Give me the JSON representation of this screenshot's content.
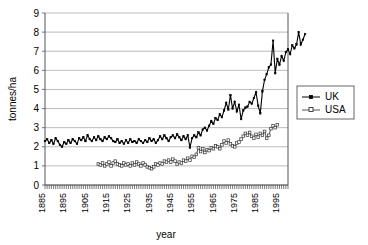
{
  "chart_data": {
    "type": "line",
    "title": "",
    "xlabel": "year",
    "ylabel": "tonnes/ha",
    "xlim": [
      1885,
      1999
    ],
    "ylim": [
      0,
      9
    ],
    "ytick_labels": [
      "0",
      "1",
      "2",
      "3",
      "4",
      "5",
      "6",
      "7",
      "8",
      "9"
    ],
    "xtick_labels": [
      "1885",
      "1895",
      "1905",
      "1915",
      "1925",
      "1935",
      "1945",
      "1955",
      "1965",
      "1975",
      "1985",
      "1995"
    ],
    "xtick_step": 10,
    "minor_xtick_step": 1,
    "grid": "horizontal",
    "legend_position": "right-outside",
    "legend_entries": [
      "UK",
      "USA"
    ],
    "series": [
      {
        "name": "UK",
        "marker": "filled-square",
        "color": "#000000",
        "x_start": 1885,
        "values": [
          2.3,
          2.4,
          2.2,
          2.35,
          2.15,
          2.45,
          2.3,
          2.1,
          2.0,
          2.25,
          2.15,
          2.35,
          2.2,
          2.4,
          2.3,
          2.15,
          2.45,
          2.35,
          2.5,
          2.3,
          2.6,
          2.4,
          2.3,
          2.5,
          2.35,
          2.55,
          2.4,
          2.3,
          2.5,
          2.4,
          2.55,
          2.45,
          2.3,
          2.25,
          2.4,
          2.2,
          2.3,
          2.15,
          2.35,
          2.2,
          2.4,
          2.25,
          2.3,
          2.2,
          2.4,
          2.3,
          2.2,
          2.35,
          2.25,
          2.45,
          2.3,
          2.4,
          2.2,
          2.35,
          2.55,
          2.4,
          2.6,
          2.45,
          2.3,
          2.5,
          2.6,
          2.45,
          2.65,
          2.5,
          2.35,
          2.55,
          2.4,
          2.6,
          1.95,
          2.45,
          2.6,
          2.5,
          2.75,
          2.6,
          2.9,
          3.0,
          2.85,
          3.1,
          3.35,
          3.2,
          3.5,
          3.4,
          3.7,
          3.55,
          3.9,
          4.3,
          3.95,
          4.7,
          4.0,
          4.35,
          3.85,
          4.2,
          3.45,
          3.9,
          4.05,
          4.1,
          4.35,
          4.25,
          4.55,
          4.85,
          4.15,
          3.75,
          4.9,
          5.5,
          5.8,
          6.15,
          6.3,
          7.55,
          5.85,
          6.6,
          6.3,
          6.75,
          6.5,
          6.95,
          7.1,
          6.85,
          7.3,
          7.15,
          7.35,
          8.0,
          7.35,
          7.6,
          7.9
        ],
        "peak_value": 8.0,
        "peak_year": 1984,
        "final_value": 7.9,
        "min_value": 1.95
      },
      {
        "name": "USA",
        "marker": "hollow-square",
        "color": "#555555",
        "x_start": 1910,
        "values": [
          1.1,
          1.05,
          1.15,
          1.0,
          1.1,
          1.2,
          1.0,
          1.15,
          1.25,
          1.1,
          1.05,
          1.0,
          1.15,
          1.05,
          1.1,
          1.0,
          1.15,
          1.05,
          1.2,
          1.1,
          1.0,
          1.15,
          1.05,
          0.95,
          0.9,
          0.85,
          0.95,
          1.1,
          1.05,
          1.15,
          1.1,
          1.25,
          1.2,
          1.3,
          1.2,
          1.35,
          1.25,
          1.1,
          1.2,
          1.15,
          1.3,
          1.25,
          1.4,
          1.3,
          1.5,
          1.45,
          1.6,
          1.95,
          1.75,
          1.9,
          1.7,
          1.85,
          1.8,
          1.95,
          1.9,
          2.05,
          2.0,
          1.9,
          2.1,
          2.3,
          2.2,
          2.35,
          2.15,
          2.05,
          2.0,
          2.2,
          2.25,
          2.4,
          2.55,
          2.7,
          2.6,
          2.75,
          2.55,
          2.45,
          2.65,
          2.5,
          2.7,
          2.6,
          2.8,
          2.45,
          2.6,
          2.95,
          3.1,
          3.0,
          3.15
        ],
        "final_value": 3.15,
        "min_value": 0.85
      }
    ]
  },
  "legend": {
    "items": [
      {
        "label": "UK"
      },
      {
        "label": "USA"
      }
    ]
  },
  "axes": {
    "y_title": "tonnes/ha",
    "x_title": "year"
  }
}
